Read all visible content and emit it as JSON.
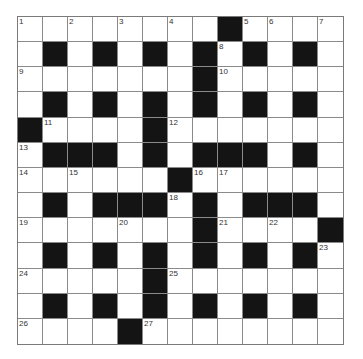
{
  "puzzle": {
    "type": "crossword",
    "rows": 13,
    "cols": 13,
    "colors": {
      "block": "#141414",
      "cell": "#ffffff",
      "gridline": "#8a8a8a",
      "number": "#333333"
    },
    "layout": [
      "........#....",
      ".#.#.#.#.#.#.",
      ".......#.....",
      ".#.#.#.#.#.#.",
      "#....#.......",
      ".###.#.###.#.",
      "......#......",
      ".#.###.#.###.",
      ".......#....#",
      ".#.#.#.#.#.#.",
      ".....#.......",
      ".#.#.#.#.#.#.",
      "....#........"
    ],
    "numbers": [
      {
        "row": 0,
        "col": 0,
        "n": "1"
      },
      {
        "row": 0,
        "col": 2,
        "n": "2"
      },
      {
        "row": 0,
        "col": 4,
        "n": "3"
      },
      {
        "row": 0,
        "col": 6,
        "n": "4"
      },
      {
        "row": 0,
        "col": 9,
        "n": "5"
      },
      {
        "row": 0,
        "col": 10,
        "n": "6"
      },
      {
        "row": 0,
        "col": 12,
        "n": "7"
      },
      {
        "row": 1,
        "col": 8,
        "n": "8"
      },
      {
        "row": 2,
        "col": 0,
        "n": "9"
      },
      {
        "row": 2,
        "col": 8,
        "n": "10"
      },
      {
        "row": 4,
        "col": 1,
        "n": "11"
      },
      {
        "row": 4,
        "col": 6,
        "n": "12"
      },
      {
        "row": 5,
        "col": 0,
        "n": "13"
      },
      {
        "row": 6,
        "col": 0,
        "n": "14"
      },
      {
        "row": 6,
        "col": 2,
        "n": "15"
      },
      {
        "row": 6,
        "col": 7,
        "n": "16"
      },
      {
        "row": 6,
        "col": 8,
        "n": "17"
      },
      {
        "row": 7,
        "col": 6,
        "n": "18"
      },
      {
        "row": 8,
        "col": 0,
        "n": "19"
      },
      {
        "row": 8,
        "col": 4,
        "n": "20"
      },
      {
        "row": 8,
        "col": 8,
        "n": "21"
      },
      {
        "row": 8,
        "col": 10,
        "n": "22"
      },
      {
        "row": 9,
        "col": 12,
        "n": "23"
      },
      {
        "row": 10,
        "col": 0,
        "n": "24"
      },
      {
        "row": 10,
        "col": 6,
        "n": "25"
      },
      {
        "row": 12,
        "col": 0,
        "n": "26"
      },
      {
        "row": 12,
        "col": 5,
        "n": "27"
      }
    ]
  }
}
